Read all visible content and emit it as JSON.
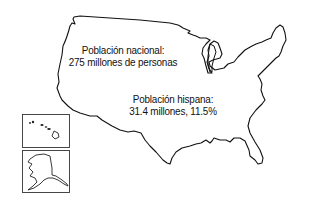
{
  "map": {
    "subject": "United States",
    "insets": [
      "Hawaii",
      "Alaska"
    ],
    "outline_color": "#111111",
    "background": "#ffffff"
  },
  "labels": {
    "national": {
      "line1": "Población nacional:",
      "line2": "275 millones de personas"
    },
    "hispanic": {
      "line1": "Población hispana:",
      "line2": "31.4 millones, 11.5%"
    }
  }
}
